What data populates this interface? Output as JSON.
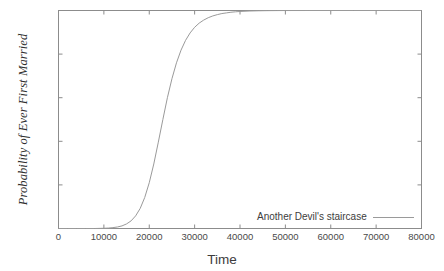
{
  "chart_data": {
    "type": "line",
    "title": "",
    "xlabel": "Time",
    "ylabel": "Probability of Ever First Married",
    "xlim": [
      0,
      80000
    ],
    "ylim": [
      0,
      1
    ],
    "grid": false,
    "legend_position": "inside bottom-right",
    "xticks": [
      0,
      10000,
      20000,
      30000,
      40000,
      50000,
      60000,
      70000,
      80000
    ],
    "xtick_labels": [
      "0",
      "10000",
      "20000",
      "30000",
      "40000",
      "50000",
      "60000",
      "70000",
      "80000"
    ],
    "yticks": [
      0,
      0.2,
      0.4,
      0.6,
      0.8,
      1
    ],
    "ytick_labels": [
      "0",
      "0.2",
      "0.4",
      "0.6",
      "0.8",
      "1"
    ],
    "series": [
      {
        "name": "Another Devil's staircase",
        "color": "#9a9a9a",
        "x": [
          0,
          2000,
          4000,
          6000,
          8000,
          10000,
          11000,
          12000,
          13000,
          14000,
          15000,
          16000,
          17000,
          18000,
          19000,
          20000,
          21000,
          22000,
          23000,
          24000,
          25000,
          26000,
          27000,
          28000,
          29000,
          30000,
          31000,
          32000,
          33000,
          34000,
          35000,
          36000,
          37000,
          38000,
          39000,
          40000,
          42000,
          44000,
          46000,
          48000,
          50000,
          55000,
          60000,
          65000,
          70000,
          75000,
          80000
        ],
        "y": [
          0,
          0,
          0,
          0,
          0,
          0.001,
          0.002,
          0.004,
          0.007,
          0.012,
          0.021,
          0.035,
          0.058,
          0.092,
          0.142,
          0.21,
          0.296,
          0.396,
          0.5,
          0.6,
          0.687,
          0.76,
          0.818,
          0.863,
          0.897,
          0.923,
          0.942,
          0.956,
          0.967,
          0.975,
          0.981,
          0.986,
          0.989,
          0.992,
          0.994,
          0.9955,
          0.9975,
          0.9986,
          0.9992,
          0.9996,
          0.9998,
          0.99995,
          1,
          1,
          1,
          1,
          1
        ]
      }
    ]
  },
  "legend": {
    "entry_label": "Another Devil's staircase"
  },
  "axes": {
    "x_axis_label": "Time",
    "y_axis_label": "Probability of Ever First Married"
  },
  "colors": {
    "line": "#9a9a9a",
    "frame": "#8c8c8c",
    "background": "#ffffff",
    "text": "#3a3a3a"
  }
}
